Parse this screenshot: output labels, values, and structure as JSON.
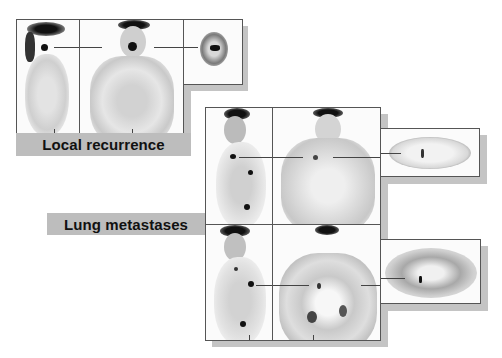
{
  "figure": {
    "groups": [
      {
        "id": "local-recurrence",
        "label": "Local recurrence",
        "views": [
          "sagittal",
          "coronal",
          "axial"
        ]
      },
      {
        "id": "lung-metastases",
        "label": "Lung metastases",
        "rows": [
          {
            "views": [
              "sagittal",
              "coronal",
              "axial"
            ]
          },
          {
            "views": [
              "sagittal",
              "coronal",
              "axial"
            ]
          }
        ]
      }
    ],
    "colors": {
      "label_bar": "#bdbdbd",
      "shadow": "#c4c4c4",
      "panel_border": "#555555",
      "hotspot": "#111111"
    }
  }
}
